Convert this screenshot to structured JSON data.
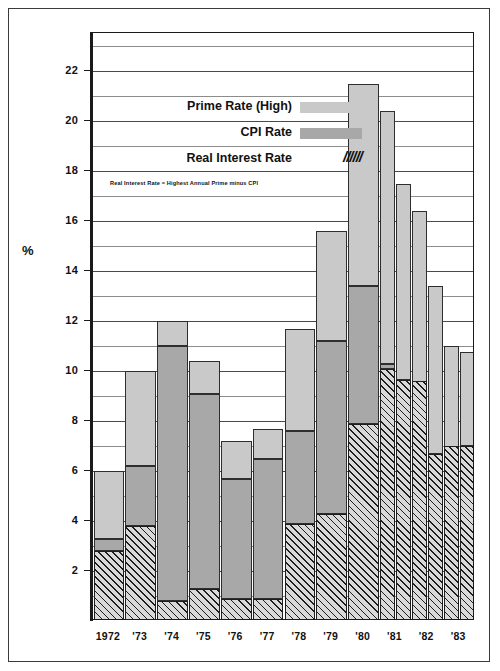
{
  "chart_data": {
    "type": "bar",
    "title": "",
    "xlabel": "",
    "ylabel": "%",
    "ylim": [
      0,
      23
    ],
    "ytick_step": 2,
    "grid": true,
    "legend_position": "inside-top-left",
    "categories": [
      "1972",
      "'73",
      "'74",
      "'75",
      "'76",
      "'77",
      "'78",
      "'79",
      "'80",
      "'81",
      "'82",
      "'83"
    ],
    "tick_labels_y": [
      "2",
      "4",
      "6",
      "8",
      "10",
      "12",
      "14",
      "16",
      "18",
      "20",
      "22"
    ],
    "minor_gridlines_y": [
      1,
      3,
      5,
      7,
      9,
      11,
      13,
      15,
      17,
      19,
      21,
      23
    ],
    "series": [
      {
        "name": "Prime Rate (High)",
        "color": "#c9c9c9",
        "values": [
          6.0,
          10.0,
          12.0,
          10.4,
          7.2,
          7.7,
          11.7,
          15.6,
          21.5,
          20.4,
          16.4,
          11.0
        ]
      },
      {
        "name": "CPI Rate",
        "color": "#a8a8a8",
        "values": [
          3.3,
          6.2,
          11.0,
          9.1,
          5.7,
          6.5,
          7.6,
          11.2,
          13.4,
          10.3,
          6.7,
          3.9
        ]
      },
      {
        "name": "Real Interest Rate",
        "color": "hatched",
        "values": [
          2.8,
          3.8,
          0.8,
          1.3,
          0.9,
          0.9,
          3.9,
          4.3,
          7.9,
          10.1,
          9.6,
          7.0
        ]
      }
    ],
    "extra_bars": {
      "description": "1981, 1982 and 1983 each show a second narrower prime-rate bar",
      "1981": {
        "prime2": 17.5,
        "real2": 9.65
      },
      "1982": {
        "prime2": 13.4,
        "real2": 6.7
      },
      "1983": {
        "prime2": 10.75,
        "real2": 7.0
      }
    },
    "legend": [
      {
        "label": "Prime Rate (High)",
        "swatch": "light-gray"
      },
      {
        "label": "CPI Rate",
        "swatch": "medium-gray"
      },
      {
        "label": "Real Interest Rate",
        "swatch": "//////"
      }
    ],
    "footnote": "Real Interest Rate = Highest Annual Prime minus CPI"
  },
  "axis": {
    "y_title": "%"
  },
  "legend": {
    "prime_label": "Prime Rate (High)",
    "cpi_label": "CPI Rate",
    "real_label": "Real Interest Rate",
    "real_swatch_glyph": "//////",
    "note": "Real Interest Rate = Highest Annual Prime minus CPI"
  }
}
